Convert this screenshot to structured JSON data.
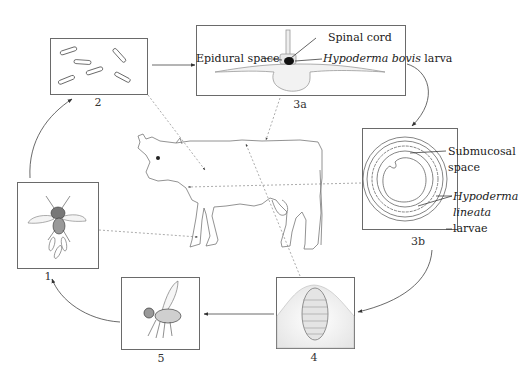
{
  "diagram": {
    "stages": [
      {
        "id": "1",
        "label": "1",
        "depicts": "adult fly laying eggs"
      },
      {
        "id": "2",
        "label": "2",
        "depicts": "eggs"
      },
      {
        "id": "3a",
        "label": "3a",
        "depicts": "vertebra cross-section with larva in epidural space"
      },
      {
        "id": "3b",
        "label": "3b",
        "depicts": "esophagus cross-section with larvae in submucosa"
      },
      {
        "id": "4",
        "label": "4",
        "depicts": "larva (warble) under skin"
      },
      {
        "id": "5",
        "label": "5",
        "depicts": "adult fly"
      }
    ],
    "annotations": {
      "spinal_cord": "Spinal cord",
      "epidural_space": "Epidural space",
      "bovis_genus_species": "Hypoderma bovis",
      "bovis_suffix": " larva",
      "submucosal_1": "Submucosal",
      "submucosal_2": "space",
      "lineata_1": "Hypoderma",
      "lineata_2": "lineata",
      "lineata_3": "larvae"
    },
    "host": "cow",
    "cycle_order": [
      "1",
      "2",
      "3a",
      "3b",
      "4",
      "5",
      "1"
    ]
  }
}
